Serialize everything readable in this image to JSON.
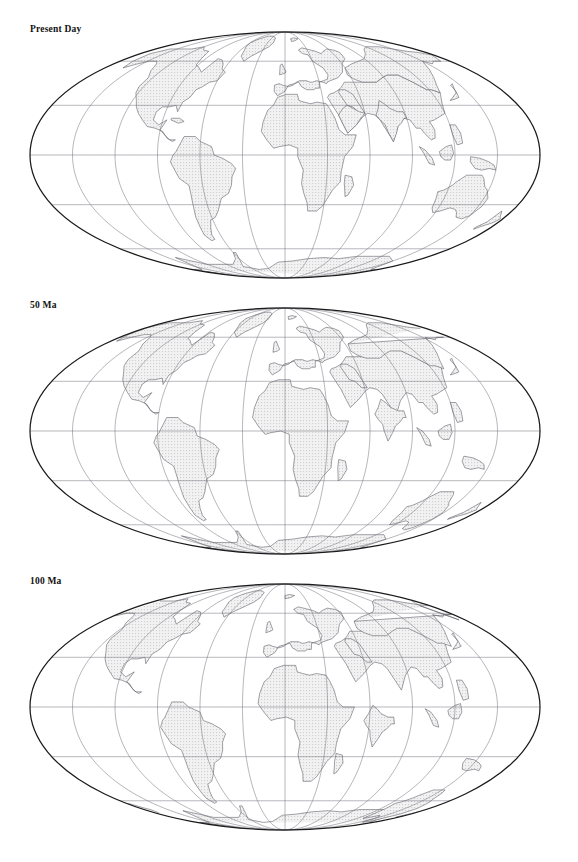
{
  "figure": {
    "kind": "paleogeographic-reconstruction-maps",
    "projection": "Mollweide",
    "background_color": "#ffffff",
    "outline_color": "#1a1a1a",
    "graticule_color": "#6f6f78",
    "coastline_color": "#555560",
    "continent_fill": "#e9e9e9",
    "panel_count": 3
  },
  "panels": [
    {
      "id": "present-day",
      "label": "Present Day",
      "age_ma": 0,
      "center_x": 285,
      "center_y": 155,
      "radius_x": 255,
      "radius_y": 123
    },
    {
      "id": "fifty-ma",
      "label": "50 Ma",
      "age_ma": 50,
      "center_x": 285,
      "center_y": 155,
      "radius_x": 255,
      "radius_y": 123
    },
    {
      "id": "hundred-ma",
      "label": "100 Ma",
      "age_ma": 100,
      "center_x": 285,
      "center_y": 155,
      "radius_x": 255,
      "radius_y": 123
    }
  ],
  "chart_data": {
    "type": "map",
    "title": "",
    "projection": "Mollweide",
    "graticule": {
      "meridian_interval_deg": 30,
      "parallel_interval_deg": 30,
      "meridians_deg": [
        -180,
        -150,
        -120,
        -90,
        -60,
        -30,
        0,
        30,
        60,
        90,
        120,
        150,
        180
      ],
      "parallels_deg": [
        -60,
        -30,
        0,
        30,
        60
      ],
      "central_meridian_deg": 0,
      "grid": true,
      "labels_shown": false
    },
    "series": [
      {
        "name": "Present Day",
        "label": "Present Day",
        "age_ma": 0,
        "description": "Modern continental configuration; Atlantic fully opened, India sutured to Asia, Australia at mid-southern latitudes, Antarctica polar."
      },
      {
        "name": "50 Ma",
        "label": "50 Ma",
        "age_ma": 50,
        "description": "Early Eocene; North and South Atlantic open but narrower, India approaching Asia as an island continent, Australia still close to Antarctica."
      },
      {
        "name": "100 Ma",
        "label": "100 Ma",
        "age_ma": 100,
        "description": "Mid Cretaceous; South Atlantic a narrow rift between South America and Africa, India isolated in the Indian Ocean, Australia joined to Antarctica."
      }
    ],
    "legend_position": "none",
    "xlabel": "",
    "ylabel": ""
  }
}
